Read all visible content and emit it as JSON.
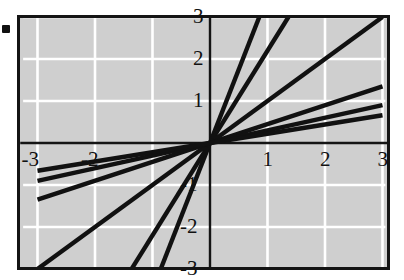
{
  "chart_data": {
    "type": "line",
    "title": "",
    "xlabel": "",
    "ylabel": "",
    "xlim": [
      -3.3,
      3.3
    ],
    "ylim": [
      -3.3,
      3.3
    ],
    "grid": true,
    "grid_color": "#ffffff",
    "plot_background": "#cfcfcf",
    "line_color": "#111111",
    "legend": "none",
    "x_ticks": [
      -3,
      -2,
      1,
      2,
      3
    ],
    "x_tick_labels": [
      "-3",
      "-2",
      "1",
      "2",
      "3"
    ],
    "y_ticks": [
      3,
      2,
      1,
      -1,
      -2,
      -3
    ],
    "y_tick_labels": [
      "3",
      "2",
      "1",
      "-1",
      "-2",
      "-3"
    ],
    "series": [
      {
        "name": "y = 3.5x",
        "slope": 3.5,
        "x": [
          -0.857,
          0.857
        ],
        "values": [
          -3,
          3
        ]
      },
      {
        "name": "y = 2.2x",
        "slope": 2.2,
        "x": [
          -1.364,
          1.364
        ],
        "values": [
          -3,
          3
        ]
      },
      {
        "name": "y = 1.0x",
        "slope": 1.0,
        "x": [
          -3,
          3
        ],
        "values": [
          -3,
          3
        ]
      },
      {
        "name": "y = 0.45x",
        "slope": 0.45,
        "x": [
          -3,
          3
        ],
        "values": [
          -1.35,
          1.35
        ]
      },
      {
        "name": "y = 0.3x",
        "slope": 0.3,
        "x": [
          -3,
          3
        ],
        "values": [
          -0.9,
          0.9
        ]
      },
      {
        "name": "y = 0.22x",
        "slope": 0.22,
        "x": [
          -3,
          3
        ],
        "values": [
          -0.66,
          0.66
        ]
      }
    ]
  },
  "marker": {
    "name": "bullet-marker"
  }
}
